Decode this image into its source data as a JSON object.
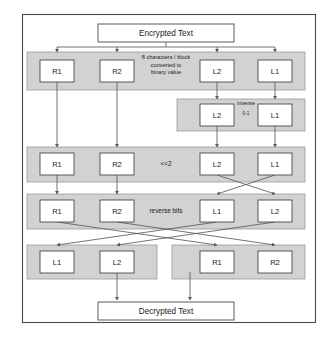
{
  "diagram": {
    "colors": {
      "band_fill": "#d2d2d2",
      "band_stroke": "#9a9a9a",
      "box_fill": "#ffffff",
      "box_stroke": "#4a4a4a",
      "connector": "#5a5a5a",
      "frame": "#4a4a4a",
      "page_background": "#ffffff"
    },
    "terminals": {
      "start": "Encrypted Text",
      "end": "Decrypted Text"
    },
    "stages": [
      {
        "id": "split",
        "note_lines": [
          "8 characters / block",
          "converted to",
          "binary value"
        ],
        "blocks": [
          "R1",
          "R2",
          "L2",
          "L1"
        ]
      },
      {
        "id": "inverse",
        "note_lines": [
          "inverse",
          "0-1"
        ],
        "blocks": [
          "L2",
          "L1"
        ]
      },
      {
        "id": "shift",
        "note_lines": [
          "<<2"
        ],
        "blocks": [
          "R1",
          "R2",
          "L2",
          "L1"
        ]
      },
      {
        "id": "reverse",
        "note_lines": [
          "reverse bits"
        ],
        "blocks": [
          "R1",
          "R2",
          "L1",
          "L2"
        ]
      },
      {
        "id": "recombine-left",
        "note_lines": [],
        "blocks": [
          "L1",
          "L2"
        ]
      },
      {
        "id": "recombine-right",
        "note_lines": [],
        "blocks": [
          "R1",
          "R2"
        ]
      }
    ]
  }
}
